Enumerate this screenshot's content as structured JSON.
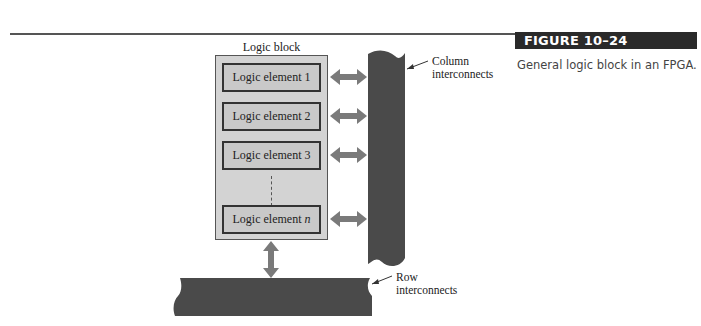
{
  "figure": {
    "label": "FIGURE 10–24",
    "caption": "General logic block in an FPGA."
  },
  "diagram": {
    "block_title": "Logic block",
    "elements": [
      {
        "label": "Logic element 1"
      },
      {
        "label": "Logic element 2"
      },
      {
        "label": "Logic element 3"
      },
      {
        "label": "Logic element n"
      }
    ],
    "column_callout": [
      "Column",
      "interconnects"
    ],
    "row_callout": [
      "Row",
      "interconnects"
    ]
  },
  "colors": {
    "interconnect": "#4a4a4a",
    "arrow": "#7a7a7a",
    "block_fill": "#d3d3d3",
    "label_bar": "#2a2a2a"
  }
}
